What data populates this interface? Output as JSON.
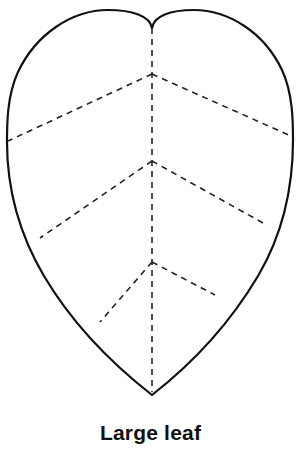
{
  "figure": {
    "caption": "Large leaf",
    "title": "Large leaf cutting template",
    "background_color": "#ffffff",
    "outline_color": "#111111",
    "vein_color": "#222222",
    "outline_stroke_width": 2.2,
    "vein_stroke_width": 1.6,
    "vein_dash_pattern": "6 5",
    "shape": {
      "type": "heart-shaped-leaf",
      "notch_point": [
        152,
        28
      ],
      "tip_point": [
        152,
        395
      ],
      "left_widest": [
        7,
        140
      ],
      "right_widest": [
        293,
        138
      ],
      "left_lobe_crest": [
        74,
        34
      ],
      "right_lobe_crest": [
        228,
        33
      ]
    },
    "outline_path": "M 152 28 C 150 16 132 10 108 10 C 72 10 36 34 18 72 C 7 96 7 124 7 142 C 7 186 18 232 44 276 C 76 330 120 370 152 395 C 184 370 226 330 258 276 C 284 232 293 186 293 140 C 293 122 293 94 282 70 C 264 32 228 10 194 10 C 170 10 154 16 152 28 Z",
    "midrib": {
      "name": "midrib",
      "from": [
        152,
        28
      ],
      "to": [
        152,
        392
      ]
    },
    "veins": [
      {
        "name": "vein-chevron-1",
        "apex": [
          152,
          74
        ],
        "left_end": [
          8,
          141
        ],
        "right_end": [
          293,
          137
        ]
      },
      {
        "name": "vein-chevron-2",
        "apex": [
          152,
          161
        ],
        "left_end": [
          40,
          238
        ],
        "right_end": [
          263,
          223
        ]
      },
      {
        "name": "vein-chevron-3",
        "apex": [
          152,
          262
        ],
        "left_end": [
          100,
          322
        ],
        "right_end": [
          215,
          295
        ]
      }
    ]
  }
}
